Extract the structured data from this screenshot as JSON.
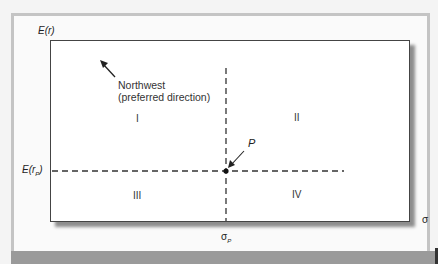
{
  "diagram": {
    "y_axis_label": "E(r)",
    "x_axis_label": "σ",
    "hline_label_main": "E(r",
    "hline_label_sub": "P",
    "hline_label_end": ")",
    "vline_label_main": "σ",
    "vline_label_sub": "P",
    "point_label": "P",
    "annotation_line1": "Northwest",
    "annotation_line2": "(preferred direction)",
    "quadrants": [
      "I",
      "II",
      "III",
      "IV"
    ]
  },
  "colors": {
    "frame": "#c4c4c4",
    "bottom_band": "#9a9a9a",
    "plot_border": "#444444",
    "line": "#333333"
  }
}
